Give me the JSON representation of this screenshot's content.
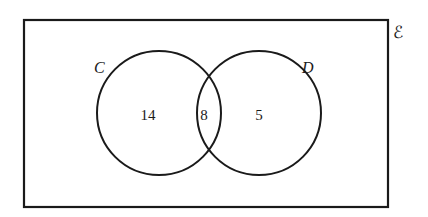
{
  "diagram": {
    "type": "venn",
    "universal_symbol": "ℰ",
    "sets": [
      {
        "name": "C",
        "label": "C"
      },
      {
        "name": "D",
        "label": "D"
      }
    ],
    "regions": {
      "c_only": "14",
      "c_and_d": "8",
      "d_only": "5"
    },
    "colors": {
      "stroke": "#1a1a1a",
      "background": "#ffffff"
    }
  }
}
